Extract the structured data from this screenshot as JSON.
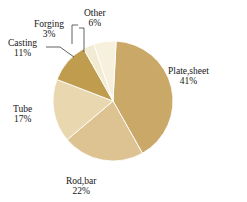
{
  "chart_data": {
    "type": "pie",
    "title": "",
    "subtitle": "",
    "xlabel": "",
    "ylabel": "",
    "legend_position": "none",
    "grid": false,
    "units": "percent",
    "start_angle_deg": 3,
    "direction": "clockwise",
    "categories": [
      "Plate,sheet",
      "Rod,bar",
      "Tube",
      "Casting",
      "Forging",
      "Other"
    ],
    "values": [
      41,
      22,
      17,
      11,
      3,
      6
    ],
    "value_labels": [
      "41%",
      "22%",
      "17%",
      "11%",
      "3%",
      "6%"
    ],
    "colors": [
      "#c9a868",
      "#ddc292",
      "#e9d7b0",
      "#c09d4e",
      "#f2ead1",
      "#f6f0dd"
    ],
    "slices": [
      {
        "label": "Plate,sheet",
        "value": 41,
        "value_label": "41%",
        "color": "#c9a868",
        "leader_line": false
      },
      {
        "label": "Rod,bar",
        "value": 22,
        "value_label": "22%",
        "color": "#ddc292",
        "leader_line": false
      },
      {
        "label": "Tube",
        "value": 17,
        "value_label": "17%",
        "color": "#e9d7b0",
        "leader_line": false
      },
      {
        "label": "Casting",
        "value": 11,
        "value_label": "11%",
        "color": "#c09d4e",
        "leader_line": true
      },
      {
        "label": "Forging",
        "value": 3,
        "value_label": "3%",
        "color": "#f2ead1",
        "leader_line": true
      },
      {
        "label": "Other",
        "value": 6,
        "value_label": "6%",
        "color": "#f6f0dd",
        "leader_line": true
      }
    ],
    "total": 100
  },
  "figure": {
    "background_color": "#ffffff",
    "slice_edge_color": "#ffffff"
  }
}
